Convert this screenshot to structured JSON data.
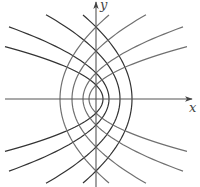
{
  "canvas": {
    "width": 200,
    "height": 187
  },
  "origin_px": {
    "x": 96,
    "y": 99
  },
  "axes": {
    "color": "#555555",
    "x_axis": {
      "label": "x",
      "from_px": 5,
      "to_px": 192,
      "label_pos": {
        "x": 189,
        "y": 112
      }
    },
    "y_axis": {
      "label": "y",
      "from_px": 187,
      "to_px": 2,
      "label_pos": {
        "x": 100,
        "y": 9
      }
    }
  },
  "families": [
    {
      "name": "left-opening parabolas",
      "equation": "y^2 = 4c(c - x)",
      "color": "#333333",
      "direction": -1,
      "c_values_px": [
        7,
        13,
        24,
        36
      ],
      "x_extent_px": [
        -91,
        -87,
        -50,
        -13
      ]
    },
    {
      "name": "right-opening parabolas",
      "equation": "y^2 = 4c(c + x)",
      "color": "#707070",
      "direction": 1,
      "c_values_px": [
        7,
        13,
        24,
        36
      ],
      "x_extent_px": [
        -91,
        -87,
        -50,
        -13
      ]
    }
  ],
  "stroke_width": 1.2
}
